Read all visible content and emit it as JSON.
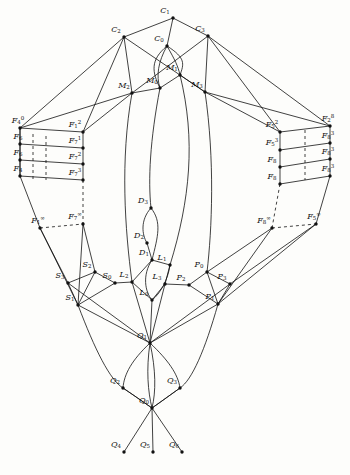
{
  "figure": {
    "type": "lattice-diagram",
    "title": "",
    "stroke_color": "#111111",
    "background_color": "#fdfdfb",
    "node_radius": 1.6
  },
  "nodes": [
    {
      "id": "C1",
      "label": "C",
      "sub": "1",
      "sup": "",
      "x": 173,
      "y": 18
    },
    {
      "id": "C2",
      "label": "C",
      "sub": "2",
      "sup": "",
      "x": 124,
      "y": 37
    },
    {
      "id": "C3",
      "label": "C",
      "sub": "3",
      "sup": "",
      "x": 208,
      "y": 36
    },
    {
      "id": "C0",
      "label": "C",
      "sub": "0",
      "sup": "",
      "x": 167,
      "y": 46
    },
    {
      "id": "M1",
      "label": "M",
      "sub": "1",
      "sup": "",
      "x": 180,
      "y": 75
    },
    {
      "id": "M2",
      "label": "M",
      "sub": "2",
      "sup": "",
      "x": 132,
      "y": 93
    },
    {
      "id": "M3",
      "label": "M",
      "sub": "3",
      "sup": "",
      "x": 205,
      "y": 92
    },
    {
      "id": "M0",
      "label": "M",
      "sub": "0",
      "sup": "",
      "x": 160,
      "y": 88
    },
    {
      "id": "F4_0",
      "label": "F",
      "sub": "4",
      "sup": "0",
      "x": 20,
      "y": 128
    },
    {
      "id": "F6_0",
      "label": "F",
      "sub": "6",
      "sup": "",
      "x": 20,
      "y": 144
    },
    {
      "id": "F6_0b",
      "label": "F",
      "sub": "6",
      "sup": "",
      "x": 20,
      "y": 160
    },
    {
      "id": "F4_b",
      "label": "F",
      "sub": "4",
      "sup": "",
      "x": 20,
      "y": 176
    },
    {
      "id": "F1_inf",
      "label": "F",
      "sub": "1",
      "sup": "∞",
      "x": 40,
      "y": 228
    },
    {
      "id": "F1_2",
      "label": "F",
      "sub": "1",
      "sup": "2",
      "x": 83,
      "y": 132
    },
    {
      "id": "F7_1",
      "label": "F",
      "sub": "7",
      "sup": "1",
      "x": 83,
      "y": 148
    },
    {
      "id": "F7_2",
      "label": "F",
      "sub": "7",
      "sup": "2",
      "x": 83,
      "y": 164
    },
    {
      "id": "F7_3",
      "label": "F",
      "sub": "7",
      "sup": "3",
      "x": 83,
      "y": 180
    },
    {
      "id": "F7_inf",
      "label": "F",
      "sub": "7",
      "sup": "∞",
      "x": 83,
      "y": 224
    },
    {
      "id": "F2_8",
      "label": "F",
      "sub": "2",
      "sup": "8",
      "x": 330,
      "y": 126
    },
    {
      "id": "F8_a",
      "label": "F",
      "sub": "8",
      "sup": "3",
      "x": 330,
      "y": 143
    },
    {
      "id": "F8_b",
      "label": "F",
      "sub": "8",
      "sup": "3",
      "x": 330,
      "y": 159
    },
    {
      "id": "F8_c",
      "label": "F",
      "sub": "8",
      "sup": "3",
      "x": 330,
      "y": 176
    },
    {
      "id": "F5_inf",
      "label": "F",
      "sub": "5",
      "sup": "∞",
      "x": 316,
      "y": 224
    },
    {
      "id": "F5_2",
      "label": "F",
      "sub": "5",
      "sup": "2",
      "x": 280,
      "y": 132
    },
    {
      "id": "F5_3",
      "label": "F",
      "sub": "5",
      "sup": "3",
      "x": 280,
      "y": 150
    },
    {
      "id": "F8_d",
      "label": "F",
      "sub": "8",
      "sup": "",
      "x": 280,
      "y": 167
    },
    {
      "id": "F8_e",
      "label": "F",
      "sub": "8",
      "sup": "",
      "x": 280,
      "y": 184
    },
    {
      "id": "F8_inf",
      "label": "F",
      "sub": "8",
      "sup": "∞",
      "x": 272,
      "y": 228
    },
    {
      "id": "D3",
      "label": "D",
      "sub": "3",
      "sup": "",
      "x": 151,
      "y": 208
    },
    {
      "id": "D2",
      "label": "D",
      "sub": "2",
      "sup": "",
      "x": 147,
      "y": 243
    },
    {
      "id": "D1",
      "label": "D",
      "sub": "1",
      "sup": "",
      "x": 152,
      "y": 260
    },
    {
      "id": "L1",
      "label": "L",
      "sub": "1",
      "sup": "",
      "x": 170,
      "y": 265
    },
    {
      "id": "L2",
      "label": "L",
      "sub": "2",
      "sup": "",
      "x": 132,
      "y": 282
    },
    {
      "id": "L3",
      "label": "L",
      "sub": "3",
      "sup": "",
      "x": 165,
      "y": 284
    },
    {
      "id": "L0",
      "label": "L",
      "sub": "0",
      "sup": "",
      "x": 152,
      "y": 300
    },
    {
      "id": "S3",
      "label": "S",
      "sub": "3",
      "sup": "",
      "x": 68,
      "y": 283
    },
    {
      "id": "S2",
      "label": "S",
      "sub": "2",
      "sup": "",
      "x": 95,
      "y": 272
    },
    {
      "id": "S1",
      "label": "S",
      "sub": "1",
      "sup": "",
      "x": 78,
      "y": 305
    },
    {
      "id": "S0",
      "label": "S",
      "sub": "0",
      "sup": "",
      "x": 115,
      "y": 283
    },
    {
      "id": "P0",
      "label": "P",
      "sub": "0",
      "sup": "",
      "x": 207,
      "y": 272
    },
    {
      "id": "P2",
      "label": "P",
      "sub": "2",
      "sup": "",
      "x": 189,
      "y": 285
    },
    {
      "id": "P3",
      "label": "P",
      "sub": "3",
      "sup": "",
      "x": 230,
      "y": 284
    },
    {
      "id": "P1",
      "label": "P",
      "sub": "1",
      "sup": "",
      "x": 218,
      "y": 304
    },
    {
      "id": "Q1",
      "label": "Q",
      "sub": "1",
      "sup": "",
      "x": 150,
      "y": 343
    },
    {
      "id": "Q2",
      "label": "Q",
      "sub": "2",
      "sup": "",
      "x": 123,
      "y": 388
    },
    {
      "id": "Q3",
      "label": "Q",
      "sub": "3",
      "sup": "",
      "x": 180,
      "y": 388
    },
    {
      "id": "Q0",
      "label": "Q",
      "sub": "0",
      "sup": "",
      "x": 152,
      "y": 408
    },
    {
      "id": "Q4",
      "label": "Q",
      "sub": "4",
      "sup": "",
      "x": 124,
      "y": 452
    },
    {
      "id": "Q5",
      "label": "Q",
      "sub": "5",
      "sup": "",
      "x": 153,
      "y": 452
    },
    {
      "id": "Q6",
      "label": "Q",
      "sub": "6",
      "sup": "",
      "x": 182,
      "y": 452
    }
  ]
}
